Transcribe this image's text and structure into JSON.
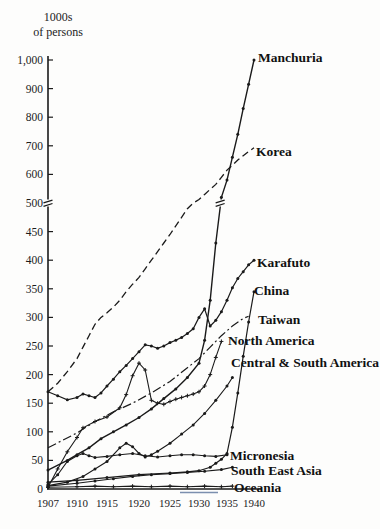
{
  "unit_label": {
    "line1": "1000s",
    "line2": "of persons"
  },
  "chart_data": {
    "type": "line",
    "title": "",
    "ylabel": "1000s of persons",
    "xlabel": "",
    "x_ticks": [
      1907,
      1910,
      1915,
      1920,
      1925,
      1930,
      1935,
      1940
    ],
    "x_tick_labels": [
      "1907",
      "1910",
      "1915",
      "1920",
      "1925",
      "1930",
      "1935",
      "1940"
    ],
    "y_axis": {
      "break_at": 500,
      "unit": "1000s of persons",
      "ticks": [
        {
          "v": 0,
          "label": "0"
        },
        {
          "v": 50,
          "label": "50"
        },
        {
          "v": 100,
          "label": "100"
        },
        {
          "v": 150,
          "label": "150"
        },
        {
          "v": 200,
          "label": "200"
        },
        {
          "v": 250,
          "label": "250"
        },
        {
          "v": 300,
          "label": "300"
        },
        {
          "v": 350,
          "label": "350"
        },
        {
          "v": 400,
          "label": "400"
        },
        {
          "v": 450,
          "label": "450"
        },
        {
          "v": 500,
          "label": "500"
        },
        {
          "v": 600,
          "label": "600"
        },
        {
          "v": 700,
          "label": "700"
        },
        {
          "v": 800,
          "label": "800"
        },
        {
          "v": 900,
          "label": "900"
        },
        {
          "v": 1000,
          "label": "1,000"
        }
      ]
    },
    "grid": false,
    "legend_position": "inline-right-of-line-ends",
    "line_color": "#1a1a1a",
    "series": [
      {
        "name": "Manchuria",
        "style": "solid",
        "marker": "dot",
        "width": 1.4,
        "has_scale_break_mark": true,
        "years": [
          1907,
          1909,
          1910,
          1912,
          1914,
          1916,
          1918,
          1920,
          1922,
          1924,
          1926,
          1928,
          1930,
          1931,
          1932,
          1933,
          1934,
          1935,
          1936,
          1937,
          1938,
          1939,
          1940
        ],
        "values": [
          33,
          50,
          60,
          72,
          88,
          100,
          112,
          125,
          140,
          158,
          175,
          195,
          220,
          260,
          330,
          430,
          520,
          580,
          660,
          740,
          830,
          915,
          1000
        ],
        "label": {
          "text": "Manchuria",
          "x": 258,
          "y": 51
        }
      },
      {
        "name": "Korea",
        "style": "dashed",
        "marker": "none",
        "width": 1.3,
        "years": [
          1907,
          1908,
          1909,
          1910,
          1911,
          1912,
          1913,
          1914,
          1915,
          1916,
          1917,
          1918,
          1919,
          1920,
          1921,
          1922,
          1923,
          1924,
          1925,
          1926,
          1927,
          1928,
          1929,
          1930,
          1931,
          1932,
          1933,
          1934,
          1935,
          1936,
          1937,
          1938,
          1939,
          1940
        ],
        "values": [
          170,
          185,
          205,
          228,
          248,
          268,
          288,
          300,
          308,
          318,
          330,
          345,
          358,
          370,
          385,
          400,
          415,
          430,
          445,
          460,
          475,
          490,
          500,
          512,
          530,
          548,
          565,
          590,
          615,
          632,
          650,
          665,
          680,
          693
        ],
        "label": {
          "text": "Korea",
          "x": 256,
          "y": 145
        }
      },
      {
        "name": "Karafuto",
        "style": "solid",
        "marker": "dot",
        "width": 1.2,
        "years": [
          1907,
          1908,
          1909,
          1910,
          1911,
          1912,
          1913,
          1914,
          1915,
          1916,
          1917,
          1918,
          1919,
          1920,
          1921,
          1922,
          1923,
          1924,
          1925,
          1926,
          1927,
          1928,
          1929,
          1930,
          1931,
          1932,
          1933,
          1934,
          1935,
          1936,
          1937,
          1938,
          1939,
          1940
        ],
        "values": [
          170,
          163,
          156,
          160,
          166,
          163,
          160,
          168,
          180,
          192,
          205,
          216,
          228,
          240,
          252,
          250,
          246,
          250,
          256,
          260,
          265,
          272,
          280,
          300,
          315,
          285,
          295,
          310,
          330,
          352,
          368,
          380,
          392,
          400
        ],
        "label": {
          "text": "Karafuto",
          "x": 257,
          "y": 256
        }
      },
      {
        "name": "China",
        "style": "solid",
        "marker": "dot",
        "width": 1.2,
        "years": [
          1907,
          1910,
          1915,
          1920,
          1925,
          1928,
          1930,
          1932,
          1933,
          1934,
          1935,
          1936,
          1937,
          1938,
          1939,
          1940
        ],
        "values": [
          12,
          15,
          20,
          25,
          28,
          30,
          32,
          38,
          45,
          52,
          62,
          108,
          168,
          232,
          292,
          345
        ],
        "label": {
          "text": "China",
          "x": 254,
          "y": 284
        }
      },
      {
        "name": "Taiwan",
        "style": "dashdot",
        "marker": "none",
        "width": 1.2,
        "years": [
          1907,
          1910,
          1913,
          1916,
          1919,
          1922,
          1925,
          1928,
          1930,
          1932,
          1934,
          1936,
          1938,
          1939
        ],
        "values": [
          72,
          98,
          118,
          135,
          150,
          168,
          188,
          212,
          228,
          248,
          268,
          285,
          298,
          302
        ],
        "label": {
          "text": "Taiwan",
          "x": 258,
          "y": 313
        }
      },
      {
        "name": "North America",
        "style": "solid",
        "marker": "plus",
        "width": 1.1,
        "years": [
          1907,
          1908,
          1909,
          1910,
          1911,
          1913,
          1915,
          1917,
          1918,
          1919,
          1920,
          1921,
          1922,
          1923,
          1924,
          1925,
          1926,
          1927,
          1928,
          1929,
          1930,
          1931,
          1932,
          1933,
          1934
        ],
        "values": [
          3,
          35,
          65,
          90,
          107,
          118,
          126,
          142,
          165,
          198,
          220,
          208,
          155,
          150,
          148,
          153,
          157,
          160,
          163,
          166,
          170,
          180,
          200,
          230,
          258
        ],
        "label": {
          "text": "North America",
          "x": 228,
          "y": 334
        }
      },
      {
        "name": "Central & South America",
        "style": "solid",
        "marker": "dot",
        "width": 1.1,
        "years": [
          1907,
          1909,
          1911,
          1913,
          1915,
          1917,
          1918,
          1919,
          1920,
          1921,
          1922,
          1923,
          1925,
          1927,
          1929,
          1931,
          1933,
          1935,
          1936
        ],
        "values": [
          6,
          12,
          22,
          35,
          48,
          72,
          80,
          74,
          62,
          56,
          60,
          66,
          80,
          96,
          112,
          132,
          155,
          180,
          195
        ],
        "label": {
          "text": "Central & South America",
          "x": 231,
          "y": 356
        }
      },
      {
        "name": "Micronesia",
        "style": "solid",
        "marker": "dot",
        "width": 1.1,
        "years": [
          1907,
          1908,
          1909,
          1910,
          1911,
          1912,
          1913,
          1915,
          1917,
          1919,
          1921,
          1923,
          1925,
          1927,
          1929,
          1931,
          1933,
          1935
        ],
        "values": [
          8,
          25,
          48,
          58,
          62,
          58,
          55,
          57,
          60,
          62,
          58,
          56,
          58,
          60,
          60,
          58,
          57,
          60
        ],
        "label": {
          "text": "Micronesia",
          "x": 230,
          "y": 449
        }
      },
      {
        "name": "South East Asia",
        "style": "solid",
        "marker": "dot",
        "width": 1.1,
        "years": [
          1907,
          1910,
          1913,
          1916,
          1919,
          1922,
          1925,
          1928,
          1931,
          1934,
          1936
        ],
        "values": [
          5,
          10,
          14,
          18,
          22,
          25,
          27,
          29,
          31,
          34,
          38
        ],
        "label": {
          "text": "South East Asia",
          "x": 231,
          "y": 464
        }
      },
      {
        "name": "Oceania",
        "style": "solid",
        "marker": "plus",
        "width": 1.1,
        "years": [
          1907,
          1910,
          1913,
          1916,
          1919,
          1922,
          1925,
          1928,
          1931,
          1934,
          1936
        ],
        "values": [
          3,
          4,
          5,
          4,
          5,
          4,
          5,
          4,
          5,
          4,
          5
        ],
        "label": {
          "text": "Oceania",
          "x": 234,
          "y": 481
        }
      }
    ],
    "artifact_color": "#7b8fae"
  }
}
